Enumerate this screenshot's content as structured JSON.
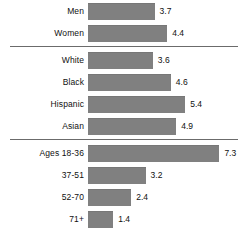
{
  "chart_data": {
    "type": "bar",
    "orientation": "horizontal",
    "title": "",
    "xlabel": "",
    "ylabel": "",
    "grid": false,
    "legend": null,
    "xlim": [
      0,
      7.3
    ],
    "categories": [
      "Men",
      "Women",
      "White",
      "Black",
      "Hispanic",
      "Asian",
      "Ages 18-36",
      "37-51",
      "52-70",
      "71+"
    ],
    "values": [
      3.7,
      4.4,
      3.6,
      4.6,
      5.4,
      4.9,
      7.3,
      3.2,
      2.4,
      1.4
    ],
    "groups": [
      {
        "name": "gender",
        "rows": [
          {
            "label": "Men",
            "value": 3.7,
            "value_label": "3.7"
          },
          {
            "label": "Women",
            "value": 4.4,
            "value_label": "4.4"
          }
        ]
      },
      {
        "name": "race-ethnicity",
        "rows": [
          {
            "label": "White",
            "value": 3.6,
            "value_label": "3.6"
          },
          {
            "label": "Black",
            "value": 4.6,
            "value_label": "4.6"
          },
          {
            "label": "Hispanic",
            "value": 5.4,
            "value_label": "5.4"
          },
          {
            "label": "Asian",
            "value": 4.9,
            "value_label": "4.9"
          }
        ]
      },
      {
        "name": "age",
        "rows": [
          {
            "label": "Ages 18-36",
            "value": 7.3,
            "value_label": "7.3"
          },
          {
            "label": "37-51",
            "value": 3.2,
            "value_label": "3.2"
          },
          {
            "label": "52-70",
            "value": 2.4,
            "value_label": "2.4"
          },
          {
            "label": "71+",
            "value": 1.4,
            "value_label": "1.4"
          }
        ]
      }
    ]
  },
  "style": {
    "bar_color": "#808080",
    "bar_edge_color": "#777777",
    "separator_color": "#6b6b6b",
    "text_color": "#101010",
    "background": "#ffffff",
    "px_per_unit": 18
  }
}
